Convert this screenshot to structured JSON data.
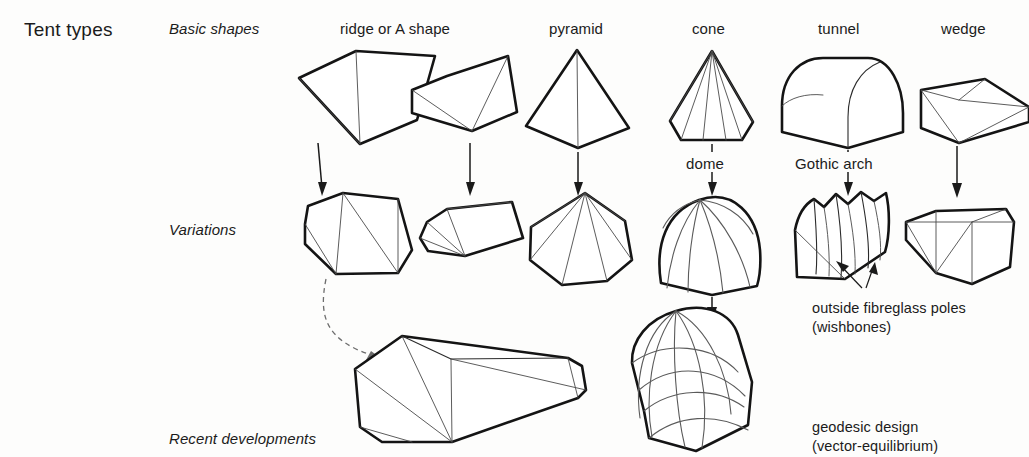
{
  "title": "Tent types",
  "rows": [
    {
      "key": "basic",
      "label": "Basic shapes"
    },
    {
      "key": "variations",
      "label": "Variations"
    },
    {
      "key": "recent",
      "label": "Recent developments"
    }
  ],
  "columns": [
    {
      "key": "ridge",
      "label": "ridge or A shape"
    },
    {
      "key": "pyramid",
      "label": "pyramid"
    },
    {
      "key": "cone",
      "label": "cone"
    },
    {
      "key": "tunnel",
      "label": "tunnel"
    },
    {
      "key": "wedge",
      "label": "wedge"
    }
  ],
  "mid_labels": [
    {
      "key": "dome",
      "label": "dome"
    },
    {
      "key": "gothic-arch",
      "label": "Gothic arch"
    }
  ],
  "annotations": [
    {
      "key": "wishbones",
      "label": "outside fibreglass poles\n(wishbones)"
    },
    {
      "key": "geodesic",
      "label": "geodesic design\n(vector-equilibrium)"
    }
  ],
  "colors": {
    "ink": "#141414",
    "seam": "#4a4a4a",
    "paper": "#fdfdfc",
    "dashed": "#6d6d6d"
  }
}
